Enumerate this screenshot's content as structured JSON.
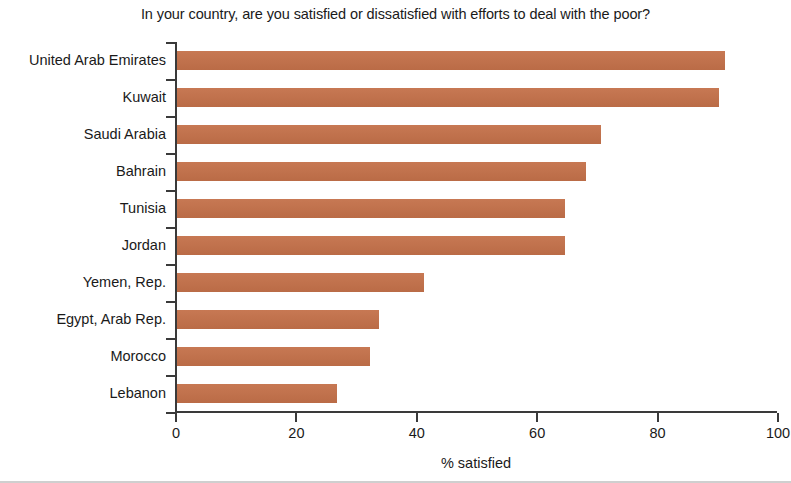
{
  "chart_data": {
    "type": "bar",
    "orientation": "horizontal",
    "title": "In your country, are you satisfied or dissatisfied with efforts to deal with the poor?",
    "xlabel": "% satisfied",
    "ylabel": "",
    "xlim": [
      0,
      100
    ],
    "xticks": [
      0,
      20,
      40,
      60,
      80,
      100
    ],
    "xtick_labels": [
      "0",
      "20",
      "40",
      "60",
      "80",
      "100"
    ],
    "grid": false,
    "legend": null,
    "bar_color": "#c4714a",
    "axis_color": "#3a3a3a",
    "text_color": "#1a1a1a",
    "categories": [
      "United Arab Emirates",
      "Kuwait",
      "Saudi Arabia",
      "Bahrain",
      "Tunisia",
      "Jordan",
      "Yemen, Rep.",
      "Egypt, Arab Rep.",
      "Morocco",
      "Lebanon"
    ],
    "values": [
      91,
      90,
      70.5,
      68,
      64.5,
      64.5,
      41,
      33.5,
      32,
      26.5
    ]
  }
}
